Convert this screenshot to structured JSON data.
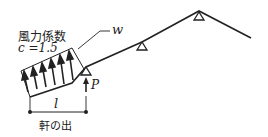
{
  "diagram": {
    "title_label": "風力係数",
    "coefficient_label": "c =1.5",
    "load_label": "w",
    "reaction_label": "P",
    "length_label": "l",
    "eave_label": "軒の出",
    "colors": {
      "line": "#222222",
      "background": "#ffffff"
    },
    "supports": [
      {
        "name": "eave-support",
        "x": 86,
        "y": 67
      },
      {
        "name": "middle-support",
        "x": 142,
        "y": 42
      },
      {
        "name": "ridge-support",
        "x": 199,
        "y": 12
      }
    ],
    "arrow_count": 6
  }
}
